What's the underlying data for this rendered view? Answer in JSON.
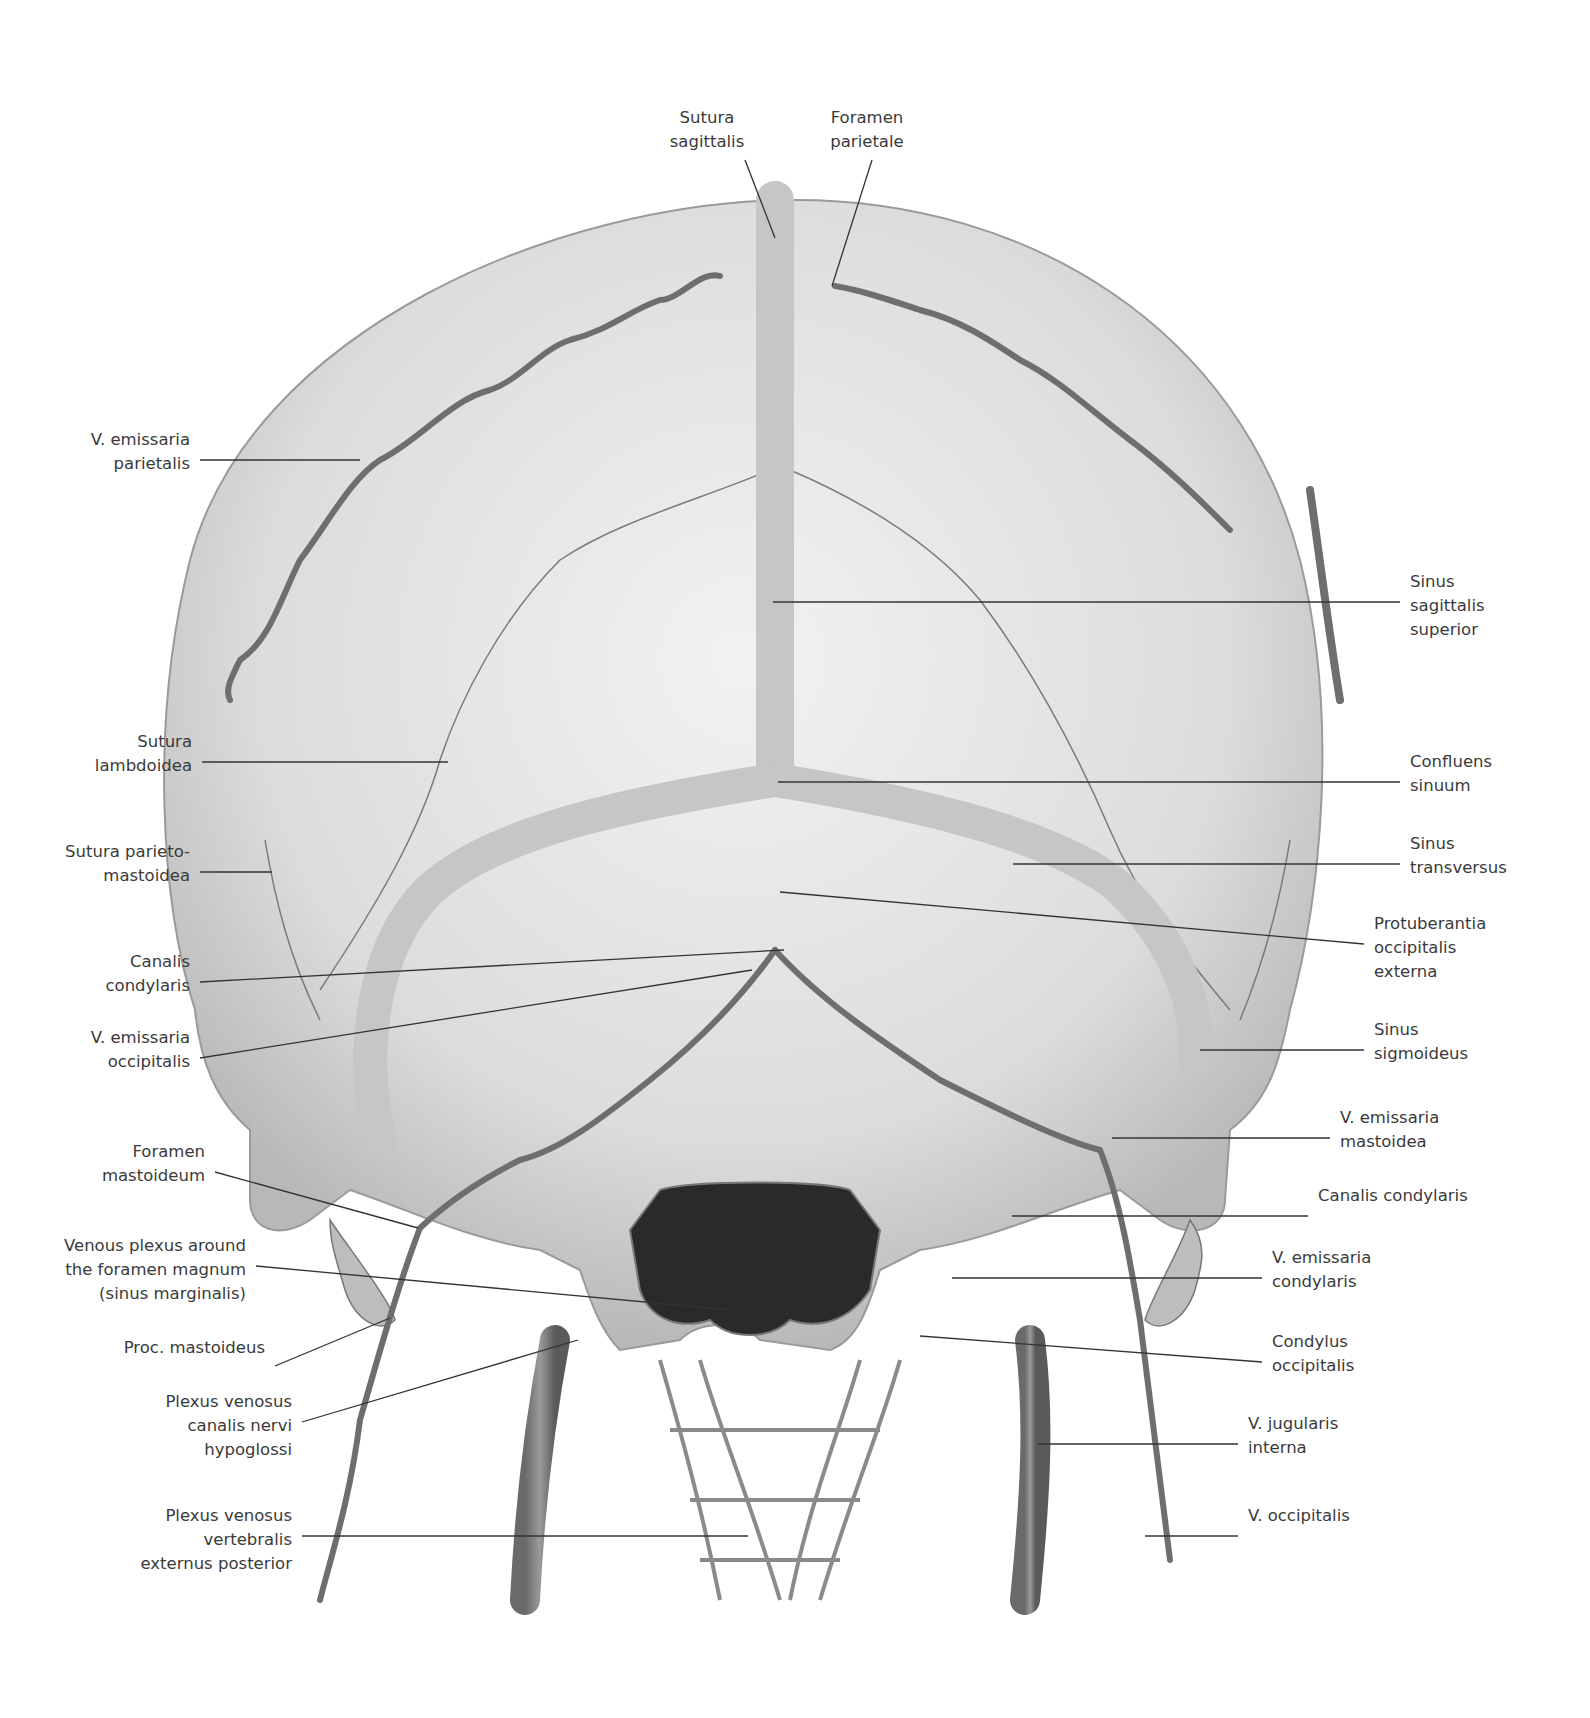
{
  "figure": {
    "colors": {
      "bone": "#d9d9d9",
      "bone_light": "#ececec",
      "vessel": "#8a8a8a",
      "vessel_dark": "#5a5a5a",
      "leader_line": "#333333",
      "text": "#3a3a3a"
    }
  },
  "labels": {
    "top": [
      {
        "id": "sutura-sagittalis",
        "text": "Sutura\nsagittalis",
        "x": 637,
        "y": 106,
        "align": "center",
        "w": 140,
        "lx1": 745,
        "ly1": 160,
        "lx2": 775,
        "ly2": 238
      },
      {
        "id": "foramen-parietale",
        "text": "Foramen\nparietale",
        "x": 797,
        "y": 106,
        "align": "center",
        "w": 140,
        "lx1": 872,
        "ly1": 160,
        "lx2": 832,
        "ly2": 286
      }
    ],
    "left": [
      {
        "id": "v-emissaria-parietalis",
        "text": "V. emissaria\nparietalis",
        "y": 450,
        "lx1": 200,
        "ly1": 460,
        "lx2": 360,
        "ly2": 460
      },
      {
        "id": "sutura-lambdoidea",
        "text": "Sutura\nlambdoidea",
        "y": 752,
        "lx1": 202,
        "ly1": 762,
        "lx2": 448,
        "ly2": 762
      },
      {
        "id": "sutura-parietomastoidea",
        "text": "Sutura parieto-\nmastoidea",
        "y": 862,
        "lx1": 200,
        "ly1": 872,
        "lx2": 272,
        "ly2": 872
      },
      {
        "id": "canalis-condylaris-left",
        "text": "Canalis\ncondylaris",
        "y": 972,
        "lx1": 200,
        "ly1": 982,
        "lx2": 784,
        "ly2": 950
      },
      {
        "id": "v-emissaria-occipitalis",
        "text": "V. emissaria\noccipitalis",
        "y": 1048,
        "lx1": 200,
        "ly1": 1058,
        "lx2": 752,
        "ly2": 970
      },
      {
        "id": "foramen-mastoideum",
        "text": "Foramen\nmastoideum",
        "y": 1162,
        "lx1": 215,
        "ly1": 1172,
        "lx2": 418,
        "ly2": 1228
      },
      {
        "id": "venous-plexus-foramen-magnum",
        "text": "Venous plexus around\nthe foramen magnum\n(sinus marginalis)",
        "y": 1256,
        "lx1": 256,
        "ly1": 1266,
        "lx2": 732,
        "ly2": 1310
      },
      {
        "id": "proc-mastoideus",
        "text": "Proc. mastoideus",
        "y": 1358,
        "lx1": 275,
        "ly1": 1366,
        "lx2": 390,
        "ly2": 1318
      },
      {
        "id": "plexus-venosus-canalis-hypoglossi",
        "text": "Plexus venosus\ncanalis nervi\nhypoglossi",
        "y": 1412,
        "lx1": 302,
        "ly1": 1422,
        "lx2": 578,
        "ly2": 1340
      },
      {
        "id": "plexus-venosus-vertebralis",
        "text": "Plexus venosus\nvertebralis\nexternus posterior",
        "y": 1526,
        "lx1": 302,
        "ly1": 1536,
        "lx2": 748,
        "ly2": 1536
      }
    ],
    "right": [
      {
        "id": "sinus-sagittalis-superior",
        "text": "Sinus\nsagittalis\nsuperior",
        "y": 592,
        "lx1": 773,
        "ly1": 602,
        "lx2": 1400,
        "ly2": 602
      },
      {
        "id": "confluens-sinuum",
        "text": "Confluens\nsinuum",
        "y": 772,
        "lx1": 778,
        "ly1": 782,
        "lx2": 1400,
        "ly2": 782
      },
      {
        "id": "sinus-transversus",
        "text": "Sinus\ntransversus",
        "y": 854,
        "lx1": 1013,
        "ly1": 864,
        "lx2": 1400,
        "ly2": 864
      },
      {
        "id": "protuberantia-occipitalis-externa",
        "text": "Protuberantia\noccipitalis\nexterna",
        "y": 934,
        "lx1": 780,
        "ly1": 892,
        "lx2": 1364,
        "ly2": 944
      },
      {
        "id": "sinus-sigmoideus",
        "text": "Sinus\nsigmoideus",
        "y": 1040,
        "lx1": 1200,
        "ly1": 1050,
        "lx2": 1364,
        "ly2": 1050
      },
      {
        "id": "v-emissaria-mastoidea",
        "text": "V. emissaria\nmastoidea",
        "y": 1128,
        "lx1": 1112,
        "ly1": 1138,
        "lx2": 1330,
        "ly2": 1138
      },
      {
        "id": "canalis-condylaris-right",
        "text": "Canalis condylaris",
        "y": 1206,
        "lx1": 1012,
        "ly1": 1216,
        "lx2": 1308,
        "ly2": 1216
      },
      {
        "id": "v-emissaria-condylaris",
        "text": "V. emissaria\ncondylaris",
        "y": 1268,
        "lx1": 952,
        "ly1": 1278,
        "lx2": 1262,
        "ly2": 1278
      },
      {
        "id": "condylus-occipitalis",
        "text": "Condylus\noccipitalis",
        "y": 1352,
        "lx1": 920,
        "ly1": 1336,
        "lx2": 1262,
        "ly2": 1362
      },
      {
        "id": "v-jugularis-interna",
        "text": "V. jugularis\ninterna",
        "y": 1434,
        "lx1": 1038,
        "ly1": 1444,
        "lx2": 1238,
        "ly2": 1444
      },
      {
        "id": "v-occipitalis",
        "text": "V. occipitalis",
        "y": 1526,
        "lx1": 1145,
        "ly1": 1536,
        "lx2": 1238,
        "ly2": 1536
      }
    ]
  }
}
